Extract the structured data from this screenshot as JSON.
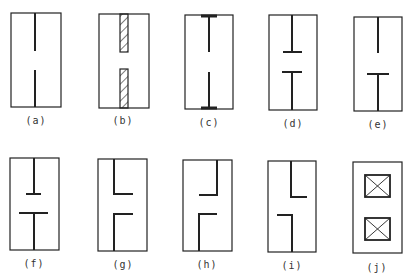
{
  "figure": {
    "stroke_color": "#222222",
    "panels": [
      {
        "id": "a",
        "label": "(a)",
        "type": "simple-wall-with-gap"
      },
      {
        "id": "b",
        "label": "(b)",
        "type": "hatched-wall-with-gap"
      },
      {
        "id": "c",
        "label": "(c)",
        "type": "wall-with-end-flanges-at-frame"
      },
      {
        "id": "d",
        "label": "(d)",
        "type": "wall-with-flanges-at-gap"
      },
      {
        "id": "e",
        "label": "(e)",
        "type": "wall-with-lower-flange-only"
      },
      {
        "id": "f",
        "label": "(f)",
        "type": "wall-with-unequal-flanges-at-gap"
      },
      {
        "id": "g",
        "label": "(g)",
        "type": "left-offset-L-walls-both-right"
      },
      {
        "id": "h",
        "label": "(h)",
        "type": "right-offset-L-walls-both-left"
      },
      {
        "id": "i",
        "label": "(i)",
        "type": "staggered-L-walls"
      },
      {
        "id": "j",
        "label": "(j)",
        "type": "two-crossed-boxes"
      }
    ]
  }
}
